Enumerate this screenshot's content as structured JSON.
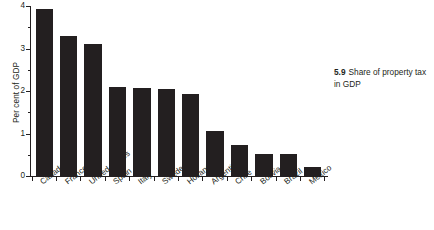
{
  "chart_data": {
    "type": "bar",
    "title": "Share of property tax in GDP",
    "figure_number": "5.9",
    "xlabel": "",
    "ylabel": "Per cent of GDP",
    "ylim": [
      0,
      4
    ],
    "yticks": [
      0,
      1,
      2,
      3,
      4
    ],
    "ytick_labels": [
      "0",
      "1",
      "2",
      "3",
      "4"
    ],
    "minor_ticks": [
      0.5,
      1.5,
      2.5,
      3.5
    ],
    "grid": false,
    "legend": null,
    "bar_color": "#231f20",
    "categories": [
      "Canada",
      "France",
      "United States",
      "Spain",
      "Italy",
      "Sweden",
      "Holland",
      "Argentina",
      "Chile",
      "Bolivia",
      "Brazil",
      "Mexico"
    ],
    "values": [
      3.92,
      3.3,
      3.1,
      2.1,
      2.08,
      2.05,
      1.92,
      1.05,
      0.72,
      0.52,
      0.52,
      0.22
    ]
  },
  "caption": {
    "number": "5.9",
    "text": "Share of property tax in GDP"
  }
}
